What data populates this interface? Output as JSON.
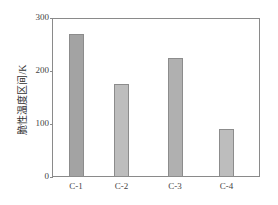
{
  "chart_data": {
    "type": "bar",
    "title": "",
    "xlabel": "",
    "ylabel": "脆性温度区间/K",
    "categories": [
      "C-1",
      "C-2",
      "C-3",
      "C-4"
    ],
    "values": [
      270,
      175,
      225,
      90
    ],
    "ylim": [
      0,
      300
    ],
    "yticks": [
      "0",
      "100",
      "200",
      "300"
    ],
    "grid": false,
    "legend": null,
    "bar_colors": [
      "#a3a3a3",
      "#bdbdbd",
      "#b0b0b0",
      "#bdbdbd"
    ]
  }
}
